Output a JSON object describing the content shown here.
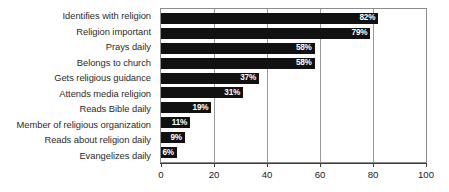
{
  "chart_data": {
    "type": "bar",
    "orientation": "horizontal",
    "title": "",
    "xlabel": "",
    "ylabel": "",
    "xlim": [
      0,
      100
    ],
    "xticks": [
      "0",
      "20",
      "40",
      "60",
      "80",
      "100"
    ],
    "grid": true,
    "legend": "none",
    "bar_color": "#111111",
    "value_label_color": "#ffffff",
    "value_suffix": "%",
    "categories": [
      "Identifies with religion",
      "Religion important",
      "Prays daily",
      "Belongs to church",
      "Gets religious guidance",
      "Attends media religion",
      "Reads Bible daily",
      "Member of religious organization",
      "Reads about religion daily",
      "Evangelizes daily"
    ],
    "values": [
      82,
      79,
      58,
      58,
      37,
      31,
      19,
      11,
      9,
      6
    ],
    "value_labels": [
      "82%",
      "79%",
      "58%",
      "58%",
      "37%",
      "31%",
      "19%",
      "11%",
      "9%",
      "6%"
    ],
    "bars": [
      {
        "category": "Identifies with religion",
        "value": 82,
        "label": "82%"
      },
      {
        "category": "Religion important",
        "value": 79,
        "label": "79%"
      },
      {
        "category": "Prays daily",
        "value": 58,
        "label": "58%"
      },
      {
        "category": "Belongs to church",
        "value": 58,
        "label": "58%"
      },
      {
        "category": "Gets religious guidance",
        "value": 37,
        "label": "37%"
      },
      {
        "category": "Attends media religion",
        "value": 31,
        "label": "31%"
      },
      {
        "category": "Reads Bible daily",
        "value": 19,
        "label": "19%"
      },
      {
        "category": "Member of religious organization",
        "value": 11,
        "label": "11%"
      },
      {
        "category": "Reads about religion daily",
        "value": 9,
        "label": "9%"
      },
      {
        "category": "Evangelizes daily",
        "value": 6,
        "label": "6%"
      }
    ]
  }
}
